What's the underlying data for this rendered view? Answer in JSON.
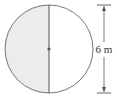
{
  "diagram": {
    "shape": "circle",
    "shaded_region": "left semicircle",
    "colors": {
      "shade": "#ececec",
      "stroke": "#555555",
      "center_dot": "#555555"
    },
    "dimension": {
      "label": "6 m",
      "measures": "diameter"
    }
  }
}
